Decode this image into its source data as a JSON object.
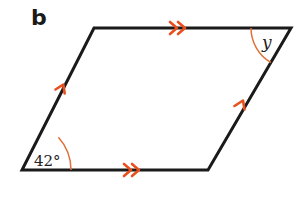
{
  "figure": {
    "part_label": "b",
    "shape": "parallelogram",
    "colors": {
      "edge": "#1a1a1a",
      "marker": "#e8501e",
      "arc": "#e0703a"
    },
    "vertices": {
      "top_left": [
        94,
        28
      ],
      "top_right": [
        291,
        28
      ],
      "bottom_right": [
        208,
        170
      ],
      "bottom_left": [
        22,
        170
      ]
    },
    "angles": [
      {
        "vertex": "bottom_left",
        "label": "42°"
      },
      {
        "vertex": "top_right",
        "label": "y"
      }
    ],
    "parallel_markers": [
      {
        "edge": "top",
        "type": "double-arrow"
      },
      {
        "edge": "bottom",
        "type": "double-arrow"
      },
      {
        "edge": "left",
        "type": "single-arrow"
      },
      {
        "edge": "right",
        "type": "single-arrow"
      }
    ]
  }
}
